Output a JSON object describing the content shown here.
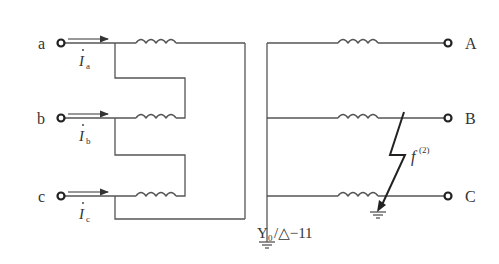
{
  "diagram": {
    "primary_terminals": [
      {
        "label": "a",
        "current": "I",
        "current_sub": "a"
      },
      {
        "label": "b",
        "current": "I",
        "current_sub": "b"
      },
      {
        "label": "c",
        "current": "I",
        "current_sub": "c"
      }
    ],
    "secondary_terminals": [
      {
        "label": "A"
      },
      {
        "label": "B"
      },
      {
        "label": "C"
      }
    ],
    "connection_label": {
      "prefix": "Y",
      "sub": "0",
      "suffix": "/△−11"
    },
    "fault_label": {
      "base": "f",
      "sup": "(2)"
    },
    "colors": {
      "line": "#555555",
      "text": "#333333",
      "background": "#ffffff"
    }
  }
}
